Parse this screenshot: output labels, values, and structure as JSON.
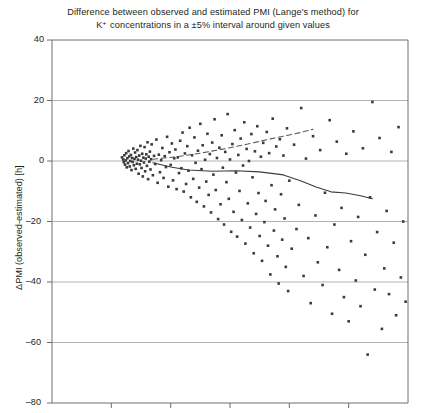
{
  "chart_data": {
    "type": "scatter",
    "title": "Difference between observed and estimated PMI (Lange's method) for K⁺ concentrations in a ±5% interval around given values",
    "title_line1": "Difference between observed and estimated PMI (Lange's method) for",
    "title_line2": "K⁺ concentrations in a ±5% interval around given values",
    "xlabel": "",
    "ylabel": "ΔPMI (observed-estimated) [h]",
    "ylim": [
      -80,
      40
    ],
    "yticks": [
      40,
      20,
      0,
      -20,
      -40,
      -60,
      -80
    ],
    "ytick_labels": [
      "40",
      "20",
      "0",
      "–20",
      "–40",
      "–60",
      "–80"
    ],
    "xlim": [
      0,
      6
    ],
    "xticks": [
      0,
      1,
      2,
      3,
      4,
      5,
      6
    ],
    "xtick_labels": [
      "",
      "",
      "",
      "",
      "",
      "",
      ""
    ],
    "grid": true,
    "grid_axis": "y",
    "legend": "none",
    "point_color": "#3b3b3b",
    "grid_color": "#a7a9ac",
    "axis_color": "#6d6e71",
    "series": [
      {
        "name": "observations",
        "marker": "square",
        "points": [
          [
            1.18,
            1.2
          ],
          [
            1.2,
            0.5
          ],
          [
            1.21,
            -0.4
          ],
          [
            1.22,
            1.9
          ],
          [
            1.23,
            -1.2
          ],
          [
            1.24,
            0.2
          ],
          [
            1.25,
            2.6
          ],
          [
            1.26,
            -2.1
          ],
          [
            1.27,
            0.9
          ],
          [
            1.28,
            -0.7
          ],
          [
            1.29,
            3.3
          ],
          [
            1.3,
            1.5
          ],
          [
            1.31,
            -1.8
          ],
          [
            1.32,
            0.0
          ],
          [
            1.33,
            2.0
          ],
          [
            1.34,
            -3.0
          ],
          [
            1.35,
            1.0
          ],
          [
            1.36,
            -0.3
          ],
          [
            1.37,
            4.1
          ],
          [
            1.38,
            -1.4
          ],
          [
            1.39,
            0.7
          ],
          [
            1.4,
            2.8
          ],
          [
            1.41,
            -2.6
          ],
          [
            1.42,
            1.3
          ],
          [
            1.43,
            -0.9
          ],
          [
            1.44,
            3.6
          ],
          [
            1.45,
            0.4
          ],
          [
            1.46,
            -4.2
          ],
          [
            1.47,
            1.8
          ],
          [
            1.48,
            -1.1
          ],
          [
            1.49,
            5.0
          ],
          [
            1.5,
            0.1
          ],
          [
            1.51,
            -2.3
          ],
          [
            1.52,
            2.4
          ],
          [
            1.53,
            -5.1
          ],
          [
            1.54,
            1.1
          ],
          [
            1.55,
            -0.5
          ],
          [
            1.56,
            4.6
          ],
          [
            1.57,
            -3.4
          ],
          [
            1.58,
            0.8
          ],
          [
            1.59,
            2.2
          ],
          [
            1.6,
            -1.6
          ],
          [
            1.61,
            6.2
          ],
          [
            1.62,
            -6.0
          ],
          [
            1.63,
            1.4
          ],
          [
            1.64,
            -0.2
          ],
          [
            1.65,
            3.1
          ],
          [
            1.66,
            -2.8
          ],
          [
            1.67,
            0.6
          ],
          [
            1.68,
            5.5
          ],
          [
            1.7,
            -4.7
          ],
          [
            1.72,
            1.7
          ],
          [
            1.74,
            -1.0
          ],
          [
            1.76,
            7.1
          ],
          [
            1.78,
            -7.2
          ],
          [
            1.8,
            2.1
          ],
          [
            1.82,
            -3.7
          ],
          [
            1.84,
            0.3
          ],
          [
            1.86,
            4.3
          ],
          [
            1.88,
            -5.6
          ],
          [
            1.9,
            1.6
          ],
          [
            1.92,
            -2.0
          ],
          [
            1.94,
            8.0
          ],
          [
            1.96,
            -8.5
          ],
          [
            1.98,
            2.9
          ],
          [
            2.0,
            -1.3
          ],
          [
            2.02,
            5.8
          ],
          [
            2.04,
            -6.4
          ],
          [
            2.06,
            0.9
          ],
          [
            2.08,
            3.8
          ],
          [
            2.1,
            -9.3
          ],
          [
            2.12,
            1.2
          ],
          [
            2.14,
            -4.0
          ],
          [
            2.16,
            6.7
          ],
          [
            2.18,
            -2.4
          ],
          [
            2.2,
            9.4
          ],
          [
            2.22,
            -10.1
          ],
          [
            2.24,
            2.5
          ],
          [
            2.26,
            -7.6
          ],
          [
            2.28,
            4.9
          ],
          [
            2.3,
            -3.2
          ],
          [
            2.32,
            11.0
          ],
          [
            2.34,
            -12.0
          ],
          [
            2.36,
            1.9
          ],
          [
            2.38,
            -5.9
          ],
          [
            2.4,
            7.8
          ],
          [
            2.42,
            -0.6
          ],
          [
            2.44,
            -13.5
          ],
          [
            2.46,
            3.4
          ],
          [
            2.48,
            -8.8
          ],
          [
            2.5,
            12.3
          ],
          [
            2.52,
            -2.7
          ],
          [
            2.54,
            5.2
          ],
          [
            2.56,
            -15.0
          ],
          [
            2.58,
            0.4
          ],
          [
            2.6,
            -6.8
          ],
          [
            2.62,
            9.0
          ],
          [
            2.64,
            -11.2
          ],
          [
            2.66,
            2.3
          ],
          [
            2.68,
            -17.0
          ],
          [
            2.7,
            6.1
          ],
          [
            2.72,
            -4.5
          ],
          [
            2.74,
            13.8
          ],
          [
            2.76,
            -9.6
          ],
          [
            2.78,
            1.0
          ],
          [
            2.8,
            -19.2
          ],
          [
            2.82,
            4.4
          ],
          [
            2.84,
            -14.3
          ],
          [
            2.86,
            8.5
          ],
          [
            2.88,
            -2.2
          ],
          [
            2.9,
            -21.0
          ],
          [
            2.92,
            3.0
          ],
          [
            2.94,
            -7.0
          ],
          [
            2.96,
            15.5
          ],
          [
            2.98,
            -12.5
          ],
          [
            3.0,
            0.5
          ],
          [
            3.02,
            -23.4
          ],
          [
            3.04,
            5.6
          ],
          [
            3.06,
            -16.8
          ],
          [
            3.08,
            10.2
          ],
          [
            3.1,
            -3.8
          ],
          [
            3.12,
            -25.0
          ],
          [
            3.14,
            2.0
          ],
          [
            3.16,
            -9.9
          ],
          [
            3.18,
            7.4
          ],
          [
            3.2,
            -19.5
          ],
          [
            3.22,
            -1.5
          ],
          [
            3.24,
            12.8
          ],
          [
            3.26,
            -27.3
          ],
          [
            3.28,
            4.0
          ],
          [
            3.3,
            -14.0
          ],
          [
            3.32,
            0.0
          ],
          [
            3.34,
            -22.0
          ],
          [
            3.36,
            8.9
          ],
          [
            3.38,
            -5.4
          ],
          [
            3.4,
            -30.5
          ],
          [
            3.42,
            3.2
          ],
          [
            3.44,
            -17.5
          ],
          [
            3.46,
            11.5
          ],
          [
            3.48,
            -10.6
          ],
          [
            3.5,
            -24.8
          ],
          [
            3.52,
            1.4
          ],
          [
            3.54,
            -33.0
          ],
          [
            3.56,
            6.0
          ],
          [
            3.58,
            -20.2
          ],
          [
            3.6,
            -13.2
          ],
          [
            3.62,
            9.6
          ],
          [
            3.64,
            -28.0
          ],
          [
            3.66,
            2.6
          ],
          [
            3.68,
            -37.5
          ],
          [
            3.7,
            -8.0
          ],
          [
            3.72,
            14.0
          ],
          [
            3.74,
            -23.0
          ],
          [
            3.76,
            -16.0
          ],
          [
            3.78,
            4.8
          ],
          [
            3.8,
            -31.5
          ],
          [
            3.82,
            -40.5
          ],
          [
            3.84,
            7.2
          ],
          [
            3.86,
            -11.0
          ],
          [
            3.88,
            -26.0
          ],
          [
            3.9,
            1.8
          ],
          [
            3.92,
            -19.0
          ],
          [
            3.94,
            -35.0
          ],
          [
            3.96,
            10.8
          ],
          [
            3.98,
            -43.0
          ],
          [
            4.0,
            -6.5
          ],
          [
            4.04,
            -29.0
          ],
          [
            4.08,
            5.4
          ],
          [
            4.12,
            -22.5
          ],
          [
            4.16,
            -14.5
          ],
          [
            4.2,
            17.5
          ],
          [
            4.24,
            -38.0
          ],
          [
            4.28,
            0.8
          ],
          [
            4.32,
            -25.5
          ],
          [
            4.36,
            -47.0
          ],
          [
            4.4,
            8.2
          ],
          [
            4.44,
            -18.0
          ],
          [
            4.48,
            -33.5
          ],
          [
            4.52,
            3.6
          ],
          [
            4.56,
            -41.0
          ],
          [
            4.6,
            -10.5
          ],
          [
            4.64,
            -28.5
          ],
          [
            4.68,
            13.5
          ],
          [
            4.72,
            -50.5
          ],
          [
            4.76,
            -21.0
          ],
          [
            4.8,
            6.4
          ],
          [
            4.84,
            -36.0
          ],
          [
            4.88,
            -15.5
          ],
          [
            4.92,
            -45.0
          ],
          [
            4.96,
            2.4
          ],
          [
            5.0,
            -53.0
          ],
          [
            5.04,
            -26.5
          ],
          [
            5.08,
            9.8
          ],
          [
            5.12,
            -39.5
          ],
          [
            5.16,
            -18.5
          ],
          [
            5.2,
            -48.0
          ],
          [
            5.24,
            4.2
          ],
          [
            5.28,
            -31.0
          ],
          [
            5.32,
            -64.0
          ],
          [
            5.36,
            -12.0
          ],
          [
            5.4,
            19.5
          ],
          [
            5.44,
            -42.5
          ],
          [
            5.48,
            -23.5
          ],
          [
            5.52,
            7.6
          ],
          [
            5.56,
            -55.5
          ],
          [
            5.6,
            -35.5
          ],
          [
            5.64,
            -16.5
          ],
          [
            5.68,
            -44.0
          ],
          [
            5.72,
            3.0
          ],
          [
            5.76,
            -27.0
          ],
          [
            5.8,
            -51.0
          ],
          [
            5.84,
            11.2
          ],
          [
            5.88,
            -38.5
          ],
          [
            5.92,
            -20.0
          ],
          [
            5.96,
            -46.5
          ]
        ]
      }
    ],
    "trend_lines": [
      {
        "name": "upper-trend",
        "style": "dashed",
        "color": "#58595b",
        "points": [
          [
            1.7,
            0.6
          ],
          [
            2.1,
            1.4
          ],
          [
            2.5,
            2.6
          ],
          [
            2.9,
            4.0
          ],
          [
            3.3,
            5.6
          ],
          [
            3.7,
            7.4
          ],
          [
            4.1,
            9.0
          ],
          [
            4.4,
            10.5
          ]
        ]
      },
      {
        "name": "lower-trend",
        "style": "solid",
        "color": "#3b3b3b",
        "points": [
          [
            1.7,
            -0.6
          ],
          [
            2.0,
            -2.0
          ],
          [
            2.3,
            -3.0
          ],
          [
            2.7,
            -3.4
          ],
          [
            3.1,
            -3.2
          ],
          [
            3.5,
            -3.6
          ],
          [
            3.9,
            -4.6
          ],
          [
            4.2,
            -6.6
          ],
          [
            4.45,
            -8.6
          ],
          [
            4.7,
            -10.2
          ],
          [
            4.95,
            -10.6
          ],
          [
            5.2,
            -11.5
          ],
          [
            5.4,
            -12.5
          ]
        ]
      }
    ]
  }
}
